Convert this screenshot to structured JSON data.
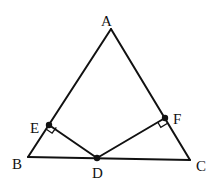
{
  "figure": {
    "type": "geometry-diagram",
    "points": {
      "A": {
        "label": "A",
        "x": 111,
        "y": 29
      },
      "B": {
        "label": "B",
        "x": 28,
        "y": 157
      },
      "C": {
        "label": "C",
        "x": 190,
        "y": 160
      },
      "D": {
        "label": "D",
        "x": 97,
        "y": 158
      },
      "E": {
        "label": "E",
        "x": 49,
        "y": 125
      },
      "F": {
        "label": "F",
        "x": 165,
        "y": 118
      }
    },
    "segments": [
      "AB",
      "AC",
      "BC",
      "DE",
      "DF"
    ],
    "right_angles": [
      "E",
      "F"
    ],
    "marked_points": [
      "D",
      "E",
      "F"
    ]
  }
}
